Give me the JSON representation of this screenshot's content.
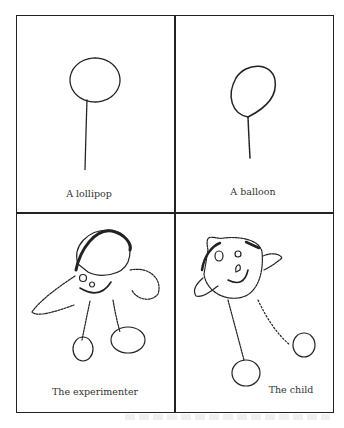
{
  "panels": [
    {
      "id": "lollipop",
      "caption": "A lollipop",
      "drawing": "lollipop-drawing"
    },
    {
      "id": "balloon",
      "caption": "A balloon",
      "drawing": "balloon-drawing"
    },
    {
      "id": "experimenter",
      "caption": "The experimenter",
      "drawing": "experimenter-figure-drawing"
    },
    {
      "id": "child",
      "caption": "The child",
      "drawing": "child-figure-drawing"
    }
  ],
  "colors": {
    "ink": "#222222",
    "background": "#ffffff"
  }
}
